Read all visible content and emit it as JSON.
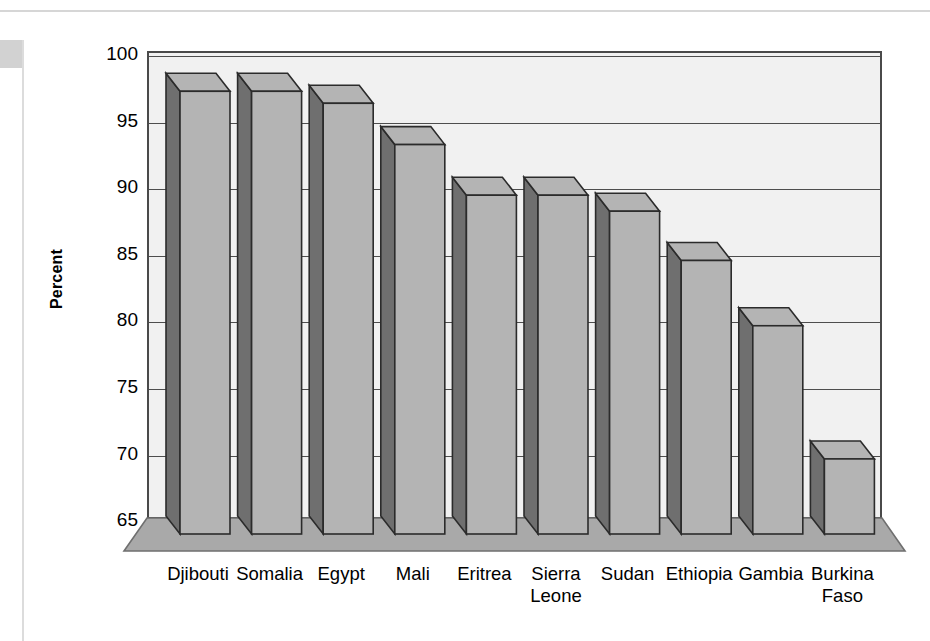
{
  "page": {
    "frame": {
      "top_rule_color": "#d6d6d6",
      "left_rule_color": "#dcdcdc",
      "corner_block_color": "#d2d2d2"
    }
  },
  "chart_data": {
    "type": "bar",
    "title": "",
    "subtitle": "",
    "xlabel": "",
    "ylabel": "Percent",
    "ylim": [
      62.5,
      101
    ],
    "yticks": [
      100,
      95,
      90,
      85,
      80,
      75,
      70,
      65
    ],
    "grid": true,
    "legend": null,
    "style": "3d-column",
    "categories": [
      "Djibouti",
      "Somalia",
      "Egypt",
      "Mali",
      "Eritrea",
      "Sierra Leone",
      "Sudan",
      "Ethiopia",
      "Gambia",
      "Burkina Faso"
    ],
    "category_lines": [
      [
        "Djibouti"
      ],
      [
        "Somalia"
      ],
      [
        "Egypt"
      ],
      [
        "Mali"
      ],
      [
        "Eritrea"
      ],
      [
        "Sierra",
        "Leone"
      ],
      [
        "Sudan"
      ],
      [
        "Ethiopia"
      ],
      [
        "Gambia"
      ],
      [
        "Burkina",
        "Faso"
      ]
    ],
    "values": [
      97.2,
      97.2,
      96.3,
      93.2,
      89.4,
      89.4,
      88.2,
      84.5,
      79.6,
      69.6
    ],
    "colors": {
      "bar_front": "#b4b4b4",
      "bar_side": "#6f6f6f",
      "bar_outline": "#2b2b2b",
      "plot_background": "#f1f1f1",
      "gridline": "#4d4d4d",
      "floor": "#a9a9a9",
      "floor_edge": "#6f6f6f",
      "axis": "#4a4a4a",
      "text": "#000000"
    }
  }
}
